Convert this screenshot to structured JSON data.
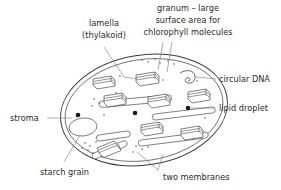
{
  "diagram": {
    "background_color": "#ffffff",
    "line_color": "#4a4a4a",
    "leader_color": "#8a8a8a",
    "text_color": "#2b2b2b",
    "droplet_color": "#1a1a1a"
  },
  "labels": {
    "lamella_line1": "lamella",
    "lamella_line2": "(thylakoid)",
    "granum_line1": "granum – large",
    "granum_line2": "surface area for",
    "granum_line3": "chlorophyll molecules",
    "circular_dna": "circular DNA",
    "lipid_droplet": "lipid droplet",
    "stroma": "stroma",
    "starch_grain": "starch grain",
    "two_membranes": "two membranes"
  },
  "structures": {
    "outer_membrane": "oval-double-membrane",
    "granum_count": 8,
    "lamella_count": 5,
    "lipid_droplet_count": 3,
    "starch_grain_count": 1,
    "circular_dna_count": 1
  }
}
